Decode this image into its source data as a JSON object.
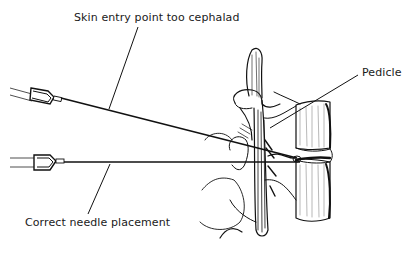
{
  "diagram": {
    "type": "medical-illustration",
    "labels": {
      "too_cephalad": "Skin entry point too cephalad",
      "correct": "Correct needle placement",
      "pedicle": "Pedicle"
    },
    "needles": [
      {
        "name": "cephalad-needle",
        "description": "angled needle entering from upper left, skin entry too cephalad"
      },
      {
        "name": "correct-needle",
        "description": "horizontal needle entering pedicle correctly"
      }
    ],
    "colors": {
      "ink": "#111111",
      "background": "#ffffff"
    }
  }
}
